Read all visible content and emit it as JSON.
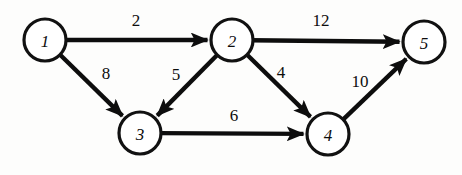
{
  "figure": {
    "type": "directed-weighted-graph",
    "background_color": "#fdfdfc",
    "ink_color": "#0d0d0d",
    "node_fill_color": "#ffffff"
  },
  "chart_data": {
    "type": "diagram",
    "title": "",
    "xlabel": "",
    "ylabel": "",
    "nodes": [
      {
        "id": "n1",
        "label": "1",
        "cx": 45,
        "cy": 40,
        "r": 21
      },
      {
        "id": "n2",
        "label": "2",
        "cx": 232,
        "cy": 40,
        "r": 21
      },
      {
        "id": "n3",
        "label": "3",
        "cx": 140,
        "cy": 133,
        "r": 21
      },
      {
        "id": "n4",
        "label": "4",
        "cx": 328,
        "cy": 134,
        "r": 21
      },
      {
        "id": "n5",
        "label": "5",
        "cx": 424,
        "cy": 42,
        "r": 21
      }
    ],
    "edges": [
      {
        "id": "e1",
        "from": "n1",
        "to": "n2",
        "weight": "2",
        "label_x": 136,
        "label_y": 20,
        "directed": true
      },
      {
        "id": "e2",
        "from": "n1",
        "to": "n3",
        "weight": "8",
        "label_x": 106,
        "label_y": 73,
        "directed": true
      },
      {
        "id": "e3",
        "from": "n2",
        "to": "n3",
        "weight": "5",
        "label_x": 176,
        "label_y": 74,
        "directed": true
      },
      {
        "id": "e4",
        "from": "n2",
        "to": "n4",
        "weight": "4",
        "label_x": 281,
        "label_y": 72,
        "directed": true
      },
      {
        "id": "e5",
        "from": "n2",
        "to": "n5",
        "weight": "12",
        "label_x": 321,
        "label_y": 20,
        "directed": true
      },
      {
        "id": "e6",
        "from": "n3",
        "to": "n4",
        "weight": "6",
        "label_x": 234,
        "label_y": 115,
        "directed": true
      },
      {
        "id": "e7",
        "from": "n4",
        "to": "n5",
        "weight": "10",
        "label_x": 360,
        "label_y": 81,
        "directed": true
      }
    ]
  }
}
